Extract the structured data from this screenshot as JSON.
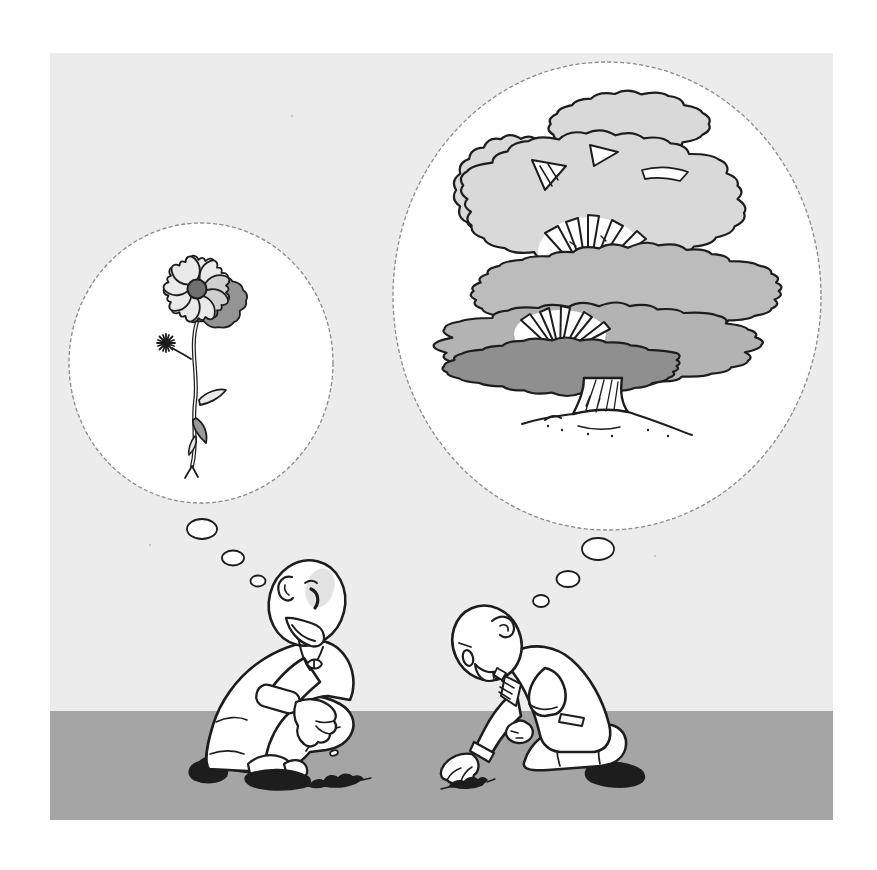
{
  "illustration": {
    "caption": "",
    "left_figure": {
      "label": "person squatting, dropping a seed",
      "thought": "flower"
    },
    "right_figure": {
      "label": "person kneeling, planting a seed",
      "thought": "large tree"
    }
  },
  "colors": {
    "page": "#ffffff",
    "backdrop": "#ececec",
    "ground": "#a5a5a5",
    "ink": "#1d1d1d",
    "white": "#ffffff",
    "bubble_stroke": "#8a8a8a",
    "canopy_light": "#d9d9d9",
    "canopy_mid": "#bcbcbc",
    "canopy_mid2": "#b3b3b3",
    "canopy_dark": "#8f8f8f",
    "petal": "#eaeaea",
    "petal_dim": "#cfcfcf",
    "petal_shade": "#949494",
    "flower_center": "#6f6f6f",
    "leaf_dark": "#9a9a9a",
    "head_shade": "#e3e3e3",
    "speckle": "#c9c9c9"
  },
  "clouds": {
    "canopy_left": {
      "cx": 521,
      "cy": 190,
      "rx": 63,
      "ry": 52,
      "bumps": 20,
      "seed": 3,
      "amp": 0.07,
      "bump": 8,
      "fill": "canopy_light"
    },
    "canopy_top": {
      "cx": 628,
      "cy": 124,
      "rx": 75,
      "ry": 30,
      "bumps": 18,
      "seed": 5,
      "amp": 0.08,
      "bump": 7,
      "fill": "canopy_light"
    },
    "canopy_main": {
      "cx": 601,
      "cy": 199,
      "rx": 139,
      "ry": 64,
      "bumps": 30,
      "seed": 9,
      "amp": 0.06,
      "bump": 8,
      "fill": "canopy_light"
    },
    "canopy_mid": {
      "cx": 628,
      "cy": 291,
      "rx": 150,
      "ry": 44,
      "bumps": 32,
      "seed": 11,
      "amp": 0.06,
      "bump": 8,
      "fill": "canopy_mid"
    },
    "canopy_low": {
      "cx": 599,
      "cy": 345,
      "rx": 158,
      "ry": 40,
      "bumps": 32,
      "seed": 13,
      "amp": 0.06,
      "bump": 8,
      "fill": "canopy_mid2"
    },
    "canopy_dark": {
      "cx": 566,
      "cy": 366,
      "rx": 117,
      "ry": 26,
      "bumps": 26,
      "seed": 17,
      "amp": 0.07,
      "bump": 6,
      "fill": "canopy_dark"
    },
    "flower_back_petals": {
      "cx": 214,
      "cy": 301,
      "rx": 33,
      "ry": 24,
      "bumps": 13,
      "seed": 4,
      "amp": 0.14,
      "bump": 5,
      "fill": "petal_shade"
    }
  }
}
